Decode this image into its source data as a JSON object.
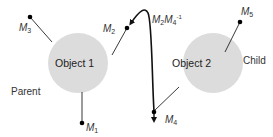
{
  "diagram": {
    "objects": [
      {
        "id": "object1",
        "label": "Object 1",
        "cx": 78,
        "cy": 63,
        "r": 30
      },
      {
        "id": "object2",
        "label": "Object 2",
        "cx": 213,
        "cy": 63,
        "r": 30
      }
    ],
    "regions": {
      "parent": "Parent",
      "child": "Child"
    },
    "markers": [
      {
        "id": "M1",
        "base": "M",
        "sub": "1"
      },
      {
        "id": "M2",
        "base": "M",
        "sub": "2"
      },
      {
        "id": "M3",
        "base": "M",
        "sub": "3"
      },
      {
        "id": "M4",
        "base": "M",
        "sub": "4"
      },
      {
        "id": "M5",
        "base": "M",
        "sub": "5"
      }
    ],
    "transform_label": {
      "a_base": "M",
      "a_sub": "2",
      "b_base": "M",
      "b_sub": "4",
      "b_sup": "-1"
    },
    "colors": {
      "circle_fill": "#dcdcdc",
      "line": "#222222",
      "dot": "#000000",
      "arrow": "#111111"
    }
  }
}
